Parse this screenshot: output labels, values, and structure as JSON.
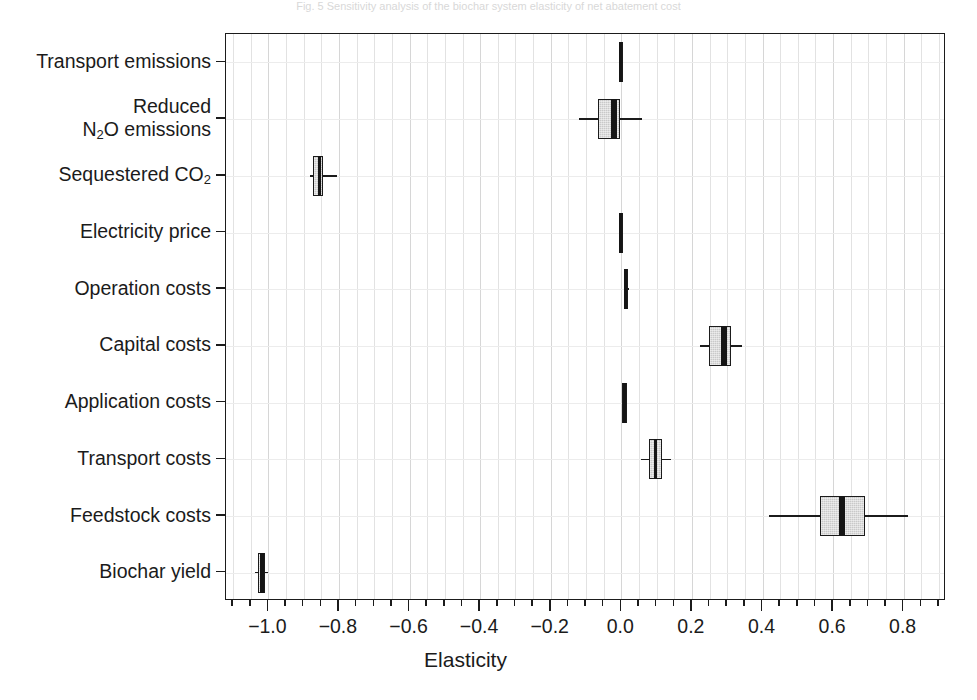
{
  "figure": {
    "cut_caption": "Fig. 5  Sensitivity analysis of the biochar system  elasticity of net abatement cost",
    "xlabel": "Elasticity"
  },
  "chart_data": {
    "type": "boxplot",
    "title": "",
    "xlabel": "Elasticity",
    "ylabel": "",
    "orientation": "horizontal",
    "xlim": [
      -1.12,
      0.92
    ],
    "xticks": [
      -1.0,
      -0.8,
      -0.6,
      -0.4,
      -0.2,
      0.0,
      0.2,
      0.4,
      0.6,
      0.8
    ],
    "xtick_labels": [
      "-1.0",
      "-0.8",
      "-0.6",
      "-0.4",
      "-0.2",
      "0.0",
      "0.2",
      "0.4",
      "0.6",
      "0.8"
    ],
    "xtick_minor_step": 0.05,
    "grid": "vertical-and-horizontal-light",
    "legend": "none",
    "categories": [
      "Transport emissions",
      "Reduced N2O emissions",
      "Sequestered CO2",
      "Electricity price",
      "Operation costs",
      "Capital costs",
      "Application costs",
      "Transport costs",
      "Feedstock costs",
      "Biochar yield"
    ],
    "boxes": [
      {
        "category": "Transport emissions",
        "label_html": "Transport emissions",
        "whisker_low": -0.006,
        "q1": -0.004,
        "median": -0.001,
        "q3": 0.002,
        "whisker_high": 0.005
      },
      {
        "category": "Reduced N2O emissions",
        "label_html": "Reduced\nN<sub>2</sub>O emissions",
        "whisker_low": -0.12,
        "q1": -0.066,
        "median": -0.021,
        "q3": -0.003,
        "whisker_high": 0.06
      },
      {
        "category": "Sequestered CO2",
        "label_html": "Sequestered CO<sub>2</sub>",
        "whisker_low": -0.882,
        "q1": -0.873,
        "median": -0.855,
        "q3": -0.845,
        "whisker_high": -0.806
      },
      {
        "category": "Electricity price",
        "label_html": "Electricity price",
        "whisker_low": -0.006,
        "q1": -0.004,
        "median": -0.001,
        "q3": 0.002,
        "whisker_high": 0.005
      },
      {
        "category": "Operation costs",
        "label_html": "Operation costs",
        "whisker_low": 0.004,
        "q1": 0.008,
        "median": 0.013,
        "q3": 0.018,
        "whisker_high": 0.023
      },
      {
        "category": "Capital costs",
        "label_html": "Capital costs",
        "whisker_low": 0.224,
        "q1": 0.249,
        "median": 0.291,
        "q3": 0.312,
        "whisker_high": 0.342
      },
      {
        "category": "Application costs",
        "label_html": "Application costs",
        "whisker_low": 0.001,
        "q1": 0.005,
        "median": 0.009,
        "q3": 0.013,
        "whisker_high": 0.017
      },
      {
        "category": "Transport costs",
        "label_html": "Transport costs",
        "whisker_low": 0.055,
        "q1": 0.079,
        "median": 0.097,
        "q3": 0.116,
        "whisker_high": 0.14
      },
      {
        "category": "Feedstock costs",
        "label_html": "Feedstock costs",
        "whisker_low": 0.418,
        "q1": 0.564,
        "median": 0.624,
        "q3": 0.691,
        "whisker_high": 0.812
      },
      {
        "category": "Biochar yield",
        "label_html": "Biochar yield",
        "whisker_low": -1.038,
        "q1": -1.029,
        "median": -1.018,
        "q3": -1.009,
        "whisker_high": -1.001
      }
    ]
  },
  "style": {
    "box_fill": "#c9c9c9",
    "line_color": "#1b1b1b",
    "grid_color": "#e2e2e2",
    "background": "#ffffff"
  }
}
